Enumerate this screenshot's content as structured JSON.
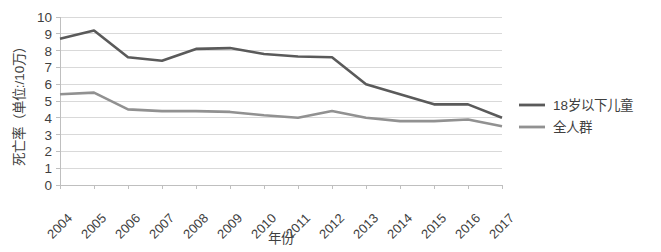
{
  "chart_data": {
    "type": "line",
    "title": "",
    "xlabel": "年份",
    "ylabel": "死亡率（单位:/10万）",
    "categories": [
      "2004",
      "2005",
      "2006",
      "2007",
      "2008",
      "2009",
      "2010",
      "2011",
      "2012",
      "2013",
      "2014",
      "2015",
      "2016",
      "2017"
    ],
    "ylim": [
      0,
      10
    ],
    "ytick_labels": [
      "10",
      "9",
      "8",
      "7",
      "6",
      "5",
      "4",
      "3",
      "2",
      "1",
      "0"
    ],
    "ytick_values": [
      10,
      9,
      8,
      7,
      6,
      5,
      4,
      3,
      2,
      1,
      0
    ],
    "grid": true,
    "legend_position": "right",
    "series": [
      {
        "name": "18岁以下儿童",
        "color": "#5a5a5a",
        "values": [
          8.7,
          9.2,
          7.6,
          7.4,
          8.1,
          8.15,
          7.8,
          7.65,
          7.6,
          6.0,
          5.4,
          4.8,
          4.8,
          4.0
        ]
      },
      {
        "name": "全人群",
        "color": "#919191",
        "values": [
          5.4,
          5.5,
          4.5,
          4.4,
          4.4,
          4.35,
          4.15,
          4.0,
          4.4,
          4.0,
          3.8,
          3.8,
          3.9,
          3.5
        ]
      }
    ]
  },
  "legend": {
    "items": [
      {
        "label": "18岁以下儿童",
        "color": "#5a5a5a"
      },
      {
        "label": "全人群",
        "color": "#919191"
      }
    ]
  },
  "colors": {
    "children_series": "#5a5a5a",
    "population_series": "#919191",
    "gridline": "#d9d9d9",
    "axis": "#bfbfbf",
    "text": "#3f3f3f",
    "background": "#ffffff"
  }
}
